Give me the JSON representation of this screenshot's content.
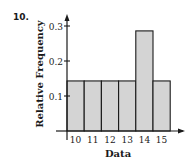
{
  "problem_number": "10.",
  "chart_data": {
    "type": "bar",
    "subtype": "histogram",
    "title": "",
    "xlabel": "Data",
    "ylabel": "Relative Frequency",
    "categories": [
      "10",
      "11",
      "12",
      "13",
      "14",
      "15"
    ],
    "values": [
      0.143,
      0.143,
      0.143,
      0.143,
      0.286,
      0.143
    ],
    "ylim": [
      0,
      0.3
    ],
    "yticks": [
      "0.1",
      "0.2",
      "0.3"
    ],
    "grid": false,
    "legend": null,
    "bar_color": "#d4d4d4",
    "edge_color": "#1a1a1a"
  }
}
